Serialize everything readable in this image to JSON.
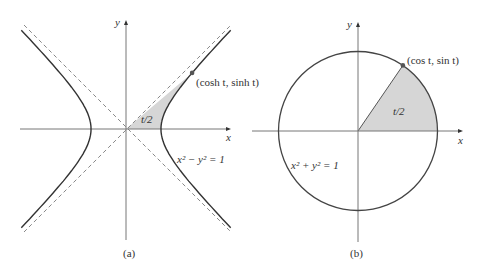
{
  "figure": {
    "colors": {
      "curve": "#333333",
      "axis": "#777777",
      "asymptote": "#888888",
      "fill": "#d6d6d6",
      "point": "#555555"
    },
    "panel_a": {
      "caption": "(a)",
      "x_axis_label": "x",
      "y_axis_label": "y",
      "curve_equation": "x² − y² = 1",
      "point_label": "(cosh t, sinh t)",
      "area_label": "t/2",
      "parameter_t": 1.25
    },
    "panel_b": {
      "caption": "(b)",
      "x_axis_label": "x",
      "y_axis_label": "y",
      "curve_equation": "x² + y² = 1",
      "point_label": "(cos t, sin t)",
      "area_label": "t/2",
      "parameter_t_radians": 0.97
    }
  }
}
